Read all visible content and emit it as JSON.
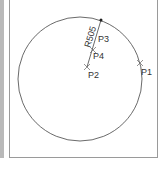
{
  "diagram": {
    "circle": {
      "cx": 80,
      "cy": 79,
      "r": 62,
      "stroke": "#444444"
    },
    "dimension": {
      "label": "R505",
      "from": [
        87,
        67
      ],
      "to": [
        101,
        20
      ]
    },
    "points": [
      {
        "name": "P1",
        "x": 140,
        "y": 63,
        "lx": 141,
        "ly": 75
      },
      {
        "name": "P2",
        "x": 87,
        "y": 67,
        "lx": 88,
        "ly": 78
      },
      {
        "name": "P3",
        "x": 99,
        "y": 36,
        "lx": 98,
        "ly": 42
      },
      {
        "name": "P4",
        "x": 93,
        "y": 50,
        "lx": 93,
        "ly": 59
      }
    ],
    "top_dot": {
      "x": 101,
      "y": 20
    }
  },
  "labels": {
    "p1": "P1",
    "p2": "P2",
    "p3": "P3",
    "p4": "P4",
    "radius": "R505"
  }
}
